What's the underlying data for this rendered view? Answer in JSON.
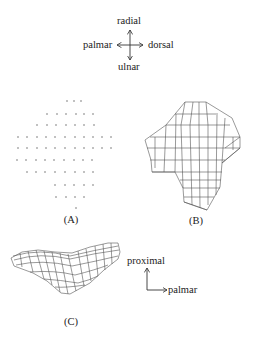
{
  "compass": {
    "up": "radial",
    "down": "ulnar",
    "left": "palmar",
    "right": "dorsal"
  },
  "panels": {
    "a": {
      "caption": "(A)",
      "description": "grid of marker points"
    },
    "b": {
      "caption": "(B)",
      "description": "surface mesh, front view"
    },
    "c": {
      "caption": "(C)",
      "description": "surface mesh, side view"
    }
  },
  "axes_c": {
    "up": "proximal",
    "right": "palmar"
  },
  "colors": {
    "line": "#444444",
    "dot": "#555555",
    "text": "#222222"
  }
}
